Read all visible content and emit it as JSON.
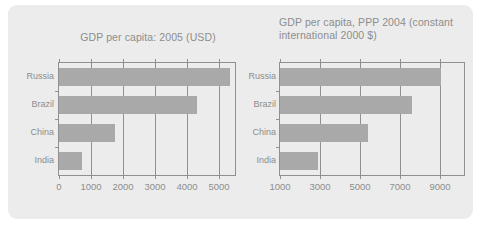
{
  "figure": {
    "background_color": "#ececec",
    "bar_color": "#a9a9a9",
    "axis_color": "#909090",
    "text_color": "#8d8d8d"
  },
  "chart_data": [
    {
      "type": "bar",
      "orientation": "horizontal",
      "title": "GDP per capita: 2005 (USD)",
      "xlabel": "",
      "ylabel": "",
      "categories": [
        "Russia",
        "Brazil",
        "China",
        "India"
      ],
      "values": [
        5350,
        4300,
        1740,
        730
      ],
      "xlim": [
        0,
        5500
      ],
      "xticks": [
        0,
        1000,
        2000,
        3000,
        4000,
        5000
      ],
      "xtick_labels": [
        "0",
        "1000",
        "2000",
        "3000",
        "4000",
        "5000"
      ],
      "grid": true,
      "legend": null
    },
    {
      "type": "bar",
      "orientation": "horizontal",
      "title": "GDP per capita, PPP 2004 (constant\ninternational 2000 $)",
      "xlabel": "",
      "ylabel": "",
      "categories": [
        "Russia",
        "Brazil",
        "China",
        "India"
      ],
      "values": [
        9050,
        7600,
        5400,
        2890
      ],
      "xlim": [
        1000,
        10200
      ],
      "xticks": [
        1000,
        3000,
        5000,
        7000,
        9000
      ],
      "xtick_labels": [
        "1000",
        "3000",
        "5000",
        "7000",
        "9000"
      ],
      "grid": true,
      "legend": null
    }
  ]
}
